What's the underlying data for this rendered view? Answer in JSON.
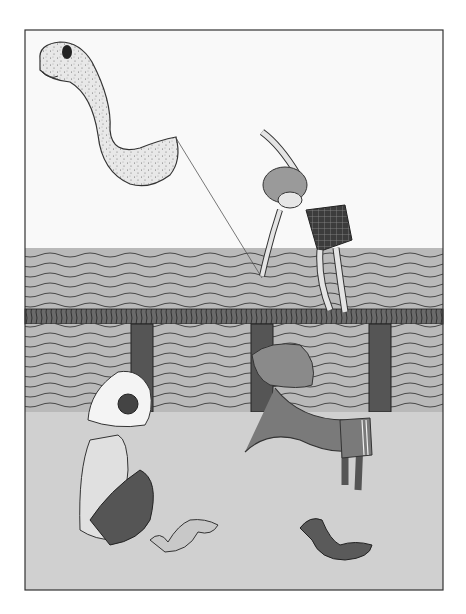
{
  "illustration": {
    "description": "Black-and-white illustration: a worm-shaped kite flying over a boardwalk railing; a boy in checkered shorts leans over the rail holding the kite string; below, a child in a white bonnet with goggles sits on the sand and a dark-skinned child in a floppy hat reaches toward two small caterpillar-like worms.",
    "colors": {
      "background": "#ffffff",
      "frame": "#333333",
      "sky": "#f8f8f8",
      "water": "#b8b8b8",
      "water_lines": "#3a3a3a",
      "rail": "#6a6a6a",
      "posts": "#555555",
      "sand": "#cfcfcf",
      "kite": "#e6e6e6",
      "skin_light": "#dedede",
      "skin_dark": "#7a7a7a",
      "shorts_check": "#444444",
      "bonnet": "#f4f4f4",
      "worm_light": "#c8c8c8",
      "worm_dark": "#5a5a5a"
    }
  }
}
